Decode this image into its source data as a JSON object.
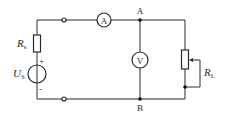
{
  "diagram": {
    "type": "circuit",
    "colors": {
      "line": "#2a2a2a",
      "background": "#ffffff"
    },
    "components": {
      "source_resistor": {
        "symbol": "R",
        "subscript": "s"
      },
      "voltage_source": {
        "symbol": "U",
        "subscript": "S",
        "plus": "+",
        "minus": "-"
      },
      "ammeter": {
        "label": "A"
      },
      "voltmeter": {
        "label": "V"
      },
      "load_rheostat": {
        "symbol": "R",
        "subscript": "L"
      }
    },
    "nodes": {
      "top": {
        "label": "A"
      },
      "bottom": {
        "label": "B"
      }
    }
  }
}
